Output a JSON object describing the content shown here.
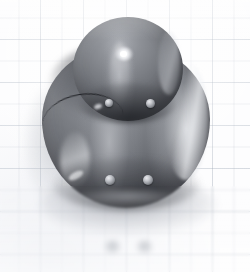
{
  "image": {
    "kind": "photograph",
    "subject": "glossy gray two-part rounded figurine",
    "background_surface": "light blue-gray graph paper"
  },
  "canvas": {
    "width": 250,
    "height": 272,
    "background_color": "#fdfdfe"
  },
  "background": {
    "paper_color": "#fdfdfe",
    "grid_minor_color": "#96a0af",
    "grid_major_color": "#8c98aa",
    "grid_minor_spacing_px": 21.5,
    "grid_major_spacing_px": 43
  },
  "object": {
    "name": "gray-glossy-figurine",
    "body": {
      "name": "lower-sphere",
      "left": 42,
      "top": 44,
      "width": 168,
      "height": 164,
      "base_color": "#6e7177",
      "shadow_color": "#303237",
      "highlight_color": "#eef0f3"
    },
    "dome": {
      "name": "upper-dome",
      "left": 73,
      "top": 17,
      "width": 110,
      "height": 104,
      "base_color": "#74777d",
      "shadow_color": "#37393e",
      "specular_color": "#ffffff"
    },
    "seam": {
      "name": "dark-seam-line",
      "color": "#18191d"
    },
    "studs": [
      {
        "name": "stud-dome-left",
        "x": 105,
        "y": 99,
        "size": 8
      },
      {
        "name": "stud-dome-right",
        "x": 146,
        "y": 99,
        "size": 9
      },
      {
        "name": "stud-body-left",
        "x": 105,
        "y": 175,
        "size": 10
      },
      {
        "name": "stud-body-right",
        "x": 143,
        "y": 175,
        "size": 10
      }
    ],
    "stud_color": "#c4c6cb"
  },
  "shadows": {
    "cast_shadow_color": "#6c717c",
    "side_shadow_color": "#7a7f8a"
  },
  "foreground_dots": [
    {
      "name": "fg-dot-left",
      "x": 104,
      "y": 240,
      "width": 17,
      "height": 14
    },
    {
      "name": "fg-dot-right",
      "x": 136,
      "y": 240,
      "width": 17,
      "height": 14
    }
  ],
  "foreground_dot_color": "#7e848e"
}
